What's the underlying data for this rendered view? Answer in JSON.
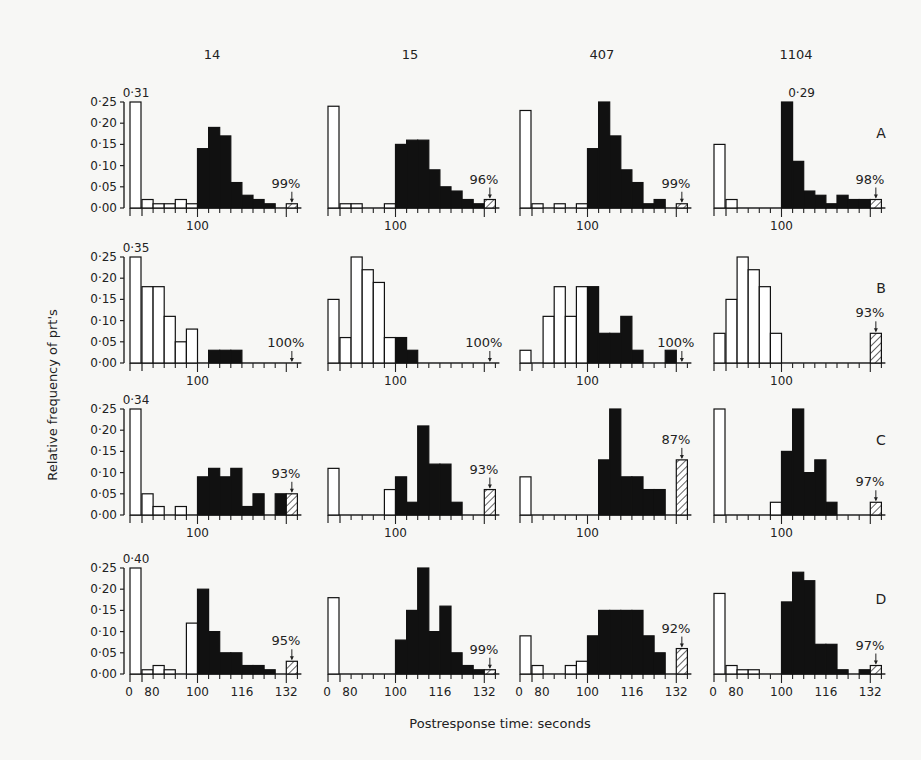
{
  "figure": {
    "ylabel": "Relative frequency of prt's",
    "xlabel": "Postresponse time: seconds",
    "columns": [
      "14",
      "15",
      "407",
      "1104"
    ],
    "rows": [
      "A",
      "B",
      "C",
      "D"
    ],
    "y_ticks": [
      "0·25",
      "0·20",
      "0·15",
      "0·10",
      "0·05",
      "0·00"
    ],
    "x_ticks_bottom": [
      "0",
      "80",
      "100",
      "116",
      "132"
    ],
    "x_tick_mid": "100"
  },
  "chart_data": {
    "type": "bar",
    "title": "",
    "xlabel": "Postresponse time: seconds",
    "ylabel": "Relative frequency of prt's",
    "ylim": [
      0,
      0.25
    ],
    "bin_edges": [
      0,
      80,
      84,
      88,
      92,
      96,
      100,
      104,
      108,
      112,
      116,
      120,
      124,
      128,
      132,
      136
    ],
    "note": "First bin (0-80) and bins below 100 are open (white); bins 100-132 are filled (black); last bin (132-136) is hatched. Values estimated from gridlines.",
    "panels": [
      {
        "row": "A",
        "col": "14",
        "top_label": "0·31",
        "pct": "99%",
        "values": [
          0.31,
          0.02,
          0.01,
          0.01,
          0.02,
          0.01,
          0.14,
          0.19,
          0.17,
          0.06,
          0.03,
          0.02,
          0.01,
          0.0,
          0.01
        ]
      },
      {
        "row": "A",
        "col": "15",
        "top_label": "",
        "pct": "96%",
        "values": [
          0.24,
          0.01,
          0.01,
          0.0,
          0.0,
          0.01,
          0.15,
          0.16,
          0.16,
          0.09,
          0.05,
          0.04,
          0.02,
          0.01,
          0.02
        ]
      },
      {
        "row": "A",
        "col": "407",
        "top_label": "",
        "pct": "99%",
        "values": [
          0.23,
          0.01,
          0.0,
          0.01,
          0.0,
          0.01,
          0.14,
          0.27,
          0.17,
          0.09,
          0.06,
          0.01,
          0.02,
          0.0,
          0.01
        ]
      },
      {
        "row": "A",
        "col": "1104",
        "top_label": "0·29",
        "pct": "98%",
        "values": [
          0.15,
          0.02,
          0.0,
          0.0,
          0.0,
          0.0,
          0.29,
          0.11,
          0.04,
          0.03,
          0.01,
          0.03,
          0.02,
          0.02,
          0.02
        ]
      },
      {
        "row": "B",
        "col": "14",
        "top_label": "0·35",
        "pct": "100%",
        "values": [
          0.35,
          0.18,
          0.18,
          0.11,
          0.05,
          0.08,
          0.0,
          0.03,
          0.03,
          0.03,
          0.0,
          0.0,
          0.0,
          0.0,
          0.0
        ]
      },
      {
        "row": "B",
        "col": "15",
        "top_label": "",
        "pct": "100%",
        "values": [
          0.15,
          0.06,
          0.25,
          0.22,
          0.19,
          0.06,
          0.06,
          0.03,
          0.0,
          0.0,
          0.0,
          0.0,
          0.0,
          0.0,
          0.0
        ]
      },
      {
        "row": "B",
        "col": "407",
        "top_label": "",
        "pct": "100%",
        "values": [
          0.03,
          0.0,
          0.11,
          0.18,
          0.11,
          0.18,
          0.18,
          0.07,
          0.07,
          0.11,
          0.03,
          0.0,
          0.0,
          0.03,
          0.0
        ]
      },
      {
        "row": "B",
        "col": "1104",
        "top_label": "",
        "pct": "93%",
        "values": [
          0.07,
          0.15,
          0.27,
          0.22,
          0.18,
          0.07,
          0.0,
          0.0,
          0.0,
          0.0,
          0.0,
          0.0,
          0.0,
          0.0,
          0.07
        ]
      },
      {
        "row": "C",
        "col": "14",
        "top_label": "0·34",
        "pct": "93%",
        "values": [
          0.34,
          0.05,
          0.02,
          0.0,
          0.02,
          0.0,
          0.09,
          0.11,
          0.09,
          0.11,
          0.02,
          0.05,
          0.0,
          0.05,
          0.05
        ]
      },
      {
        "row": "C",
        "col": "15",
        "top_label": "",
        "pct": "93%",
        "values": [
          0.11,
          0.0,
          0.0,
          0.0,
          0.0,
          0.06,
          0.09,
          0.03,
          0.21,
          0.12,
          0.12,
          0.03,
          0.0,
          0.0,
          0.06
        ]
      },
      {
        "row": "C",
        "col": "407",
        "top_label": "",
        "pct": "87%",
        "values": [
          0.09,
          0.0,
          0.0,
          0.0,
          0.0,
          0.0,
          0.0,
          0.13,
          0.28,
          0.09,
          0.09,
          0.06,
          0.06,
          0.0,
          0.13
        ]
      },
      {
        "row": "C",
        "col": "1104",
        "top_label": "",
        "pct": "97%",
        "values": [
          0.29,
          0.0,
          0.0,
          0.0,
          0.0,
          0.03,
          0.15,
          0.26,
          0.1,
          0.13,
          0.03,
          0.0,
          0.0,
          0.0,
          0.03
        ]
      },
      {
        "row": "D",
        "col": "14",
        "top_label": "0·40",
        "pct": "95%",
        "values": [
          0.4,
          0.01,
          0.02,
          0.01,
          0.0,
          0.12,
          0.2,
          0.1,
          0.05,
          0.05,
          0.02,
          0.02,
          0.01,
          0.0,
          0.03
        ]
      },
      {
        "row": "D",
        "col": "15",
        "top_label": "",
        "pct": "99%",
        "values": [
          0.18,
          0.0,
          0.0,
          0.0,
          0.0,
          0.0,
          0.08,
          0.15,
          0.26,
          0.1,
          0.16,
          0.05,
          0.02,
          0.01,
          0.01
        ]
      },
      {
        "row": "D",
        "col": "407",
        "top_label": "",
        "pct": "92%",
        "values": [
          0.09,
          0.02,
          0.0,
          0.0,
          0.02,
          0.03,
          0.09,
          0.15,
          0.15,
          0.15,
          0.15,
          0.09,
          0.05,
          0.0,
          0.06
        ]
      },
      {
        "row": "D",
        "col": "1104",
        "top_label": "",
        "pct": "97%",
        "values": [
          0.19,
          0.02,
          0.01,
          0.01,
          0.0,
          0.0,
          0.17,
          0.24,
          0.22,
          0.07,
          0.07,
          0.01,
          0.0,
          0.01,
          0.02
        ]
      }
    ]
  }
}
